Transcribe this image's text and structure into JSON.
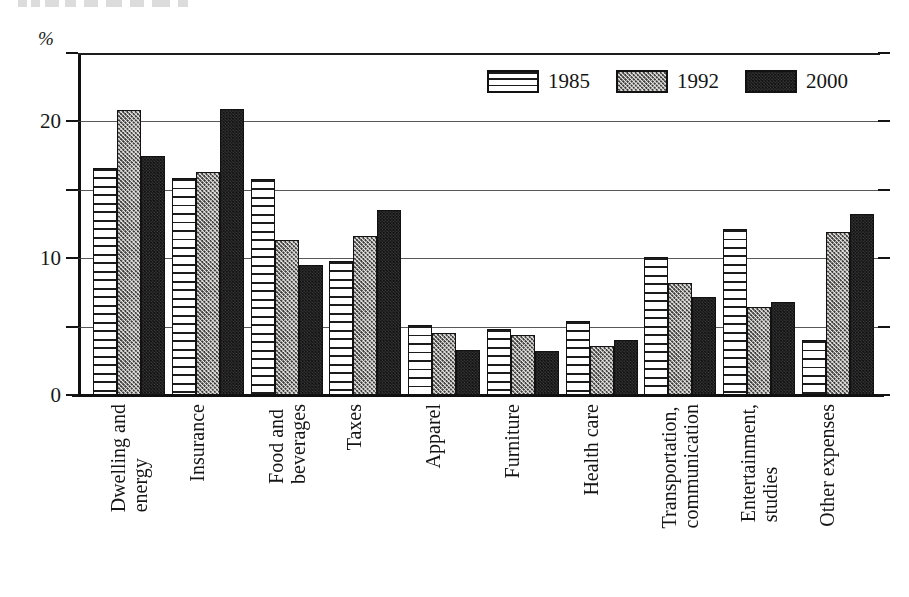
{
  "chart_data": {
    "type": "bar",
    "title": "",
    "xlabel": "",
    "ylabel": "%",
    "ylim": [
      0,
      25
    ],
    "yticks": [
      0,
      5,
      10,
      15,
      20,
      25
    ],
    "ytick_labels": [
      "0",
      "",
      "10",
      "",
      "20",
      ""
    ],
    "grid": true,
    "legend_position": "top-right",
    "categories": [
      "Dwelling and\nenergy",
      "Insurance",
      "Food and\nbeverages",
      "Taxes",
      "Apparel",
      "Furniture",
      "Health care",
      "Transportation,\ncommunication",
      "Entertainment,\nstudies",
      "Other expenses"
    ],
    "series": [
      {
        "name": "1985",
        "pattern": "horizontal-lines",
        "values": [
          16.6,
          15.9,
          15.8,
          9.8,
          5.1,
          4.8,
          5.4,
          10.1,
          12.1,
          4.0
        ]
      },
      {
        "name": "1992",
        "pattern": "stipple-dots",
        "values": [
          20.8,
          16.3,
          11.3,
          11.6,
          4.5,
          4.4,
          3.6,
          8.2,
          6.4,
          11.9
        ]
      },
      {
        "name": "2000",
        "pattern": "dark-crosshatch",
        "values": [
          17.5,
          20.9,
          9.5,
          13.5,
          3.3,
          3.2,
          4.0,
          7.2,
          6.8,
          13.2
        ]
      }
    ]
  },
  "axis": {
    "percent_symbol": "%"
  },
  "colors": {
    "ink": "#121212",
    "series_1985_fill": "#ffffff",
    "series_1992_fill": "#eceae6",
    "series_2000_fill": "#4a4a4a",
    "gridline": "#3b3b3b",
    "background": "#ffffff"
  }
}
